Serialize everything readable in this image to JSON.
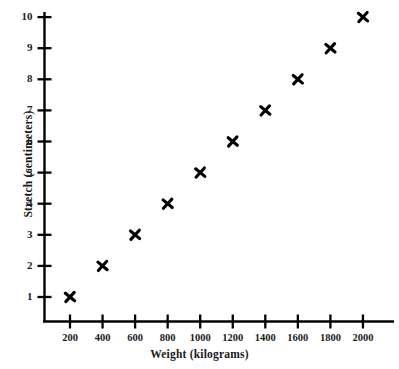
{
  "chart_data": {
    "type": "scatter",
    "title": "",
    "xlabel": "Weight (kilograms)",
    "ylabel": "Stretch (centimeters)",
    "x": [
      200,
      400,
      600,
      800,
      1000,
      1200,
      1400,
      1600,
      1800,
      2000
    ],
    "values": [
      1,
      2,
      3,
      4,
      5,
      6,
      7,
      8,
      9,
      10
    ],
    "xtick_labels": [
      "200",
      "400",
      "600",
      "800",
      "1000",
      "1200",
      "1400",
      "1600",
      "1800",
      "2000"
    ],
    "ytick_labels": [
      "1",
      "2",
      "3",
      "4",
      "5",
      "6",
      "7",
      "8",
      "9",
      "10"
    ],
    "xlim": [
      0,
      2200
    ],
    "ylim": [
      0,
      10.5
    ],
    "grid": false,
    "legend": null,
    "marker": "x-cross",
    "marker_color": "#000000",
    "axis_color": "#000000",
    "background_color": "#ffffff"
  }
}
